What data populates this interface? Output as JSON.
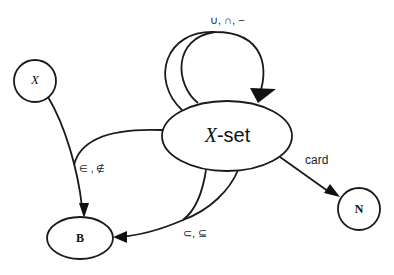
{
  "diagram": {
    "type": "state-transition",
    "nodes": [
      {
        "id": "X",
        "label": "X",
        "shape": "circle"
      },
      {
        "id": "Xset",
        "label_italic": "X",
        "label_rest": "-set",
        "shape": "ellipse"
      },
      {
        "id": "B",
        "label": "B",
        "shape": "ellipse"
      },
      {
        "id": "N",
        "label": "N",
        "shape": "circle"
      }
    ],
    "edges": [
      {
        "from": "Xset",
        "to": "Xset",
        "label": "∪, ∩, −"
      },
      {
        "from": "X",
        "to": "B",
        "label": ""
      },
      {
        "from": "Xset",
        "to": "B",
        "label": "∈ , ∉"
      },
      {
        "from": "Xset",
        "to": "B",
        "label": "⊂, ⊆"
      },
      {
        "from": "Xset",
        "to": "N",
        "label": "card"
      }
    ],
    "colors": {
      "stroke": "#1a1a1a",
      "background": "#ffffff"
    }
  }
}
